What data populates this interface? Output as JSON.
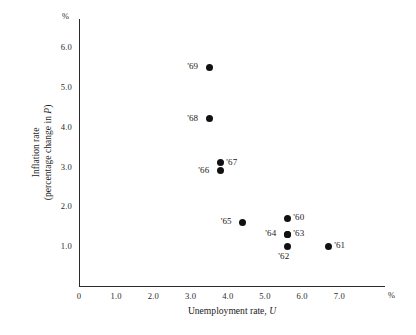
{
  "chart_data": {
    "type": "scatter",
    "title": "",
    "xlabel": "Unemployment rate, U",
    "ylabel_line1": "Inflation rate",
    "ylabel_line2": "(percentage change in P)",
    "x_unit": "%",
    "y_unit": "%",
    "xlim": [
      0,
      8.2
    ],
    "ylim": [
      0,
      6.7
    ],
    "grid": false,
    "legend": "none",
    "xticks": [
      "0",
      "1.0",
      "2.0",
      "3.0",
      "4.0",
      "5.0",
      "6.0",
      "7.0"
    ],
    "xtick_values": [
      0,
      1.0,
      2.0,
      3.0,
      4.0,
      5.0,
      6.0,
      7.0
    ],
    "yticks": [
      "1.0",
      "2.0",
      "3.0",
      "4.0",
      "5.0",
      "6.0"
    ],
    "ytick_values": [
      1.0,
      2.0,
      3.0,
      4.0,
      5.0,
      6.0
    ],
    "points": [
      {
        "label": "'69",
        "x": 3.5,
        "y": 5.5,
        "label_side": "left"
      },
      {
        "label": "'68",
        "x": 3.5,
        "y": 4.2,
        "label_side": "left"
      },
      {
        "label": "'67",
        "x": 3.8,
        "y": 3.1,
        "label_side": "right"
      },
      {
        "label": "'66",
        "x": 3.8,
        "y": 2.9,
        "label_side": "left"
      },
      {
        "label": "'65",
        "x": 4.4,
        "y": 1.6,
        "label_side": "left"
      },
      {
        "label": "'60",
        "x": 5.6,
        "y": 1.7,
        "label_side": "right"
      },
      {
        "label": "'64",
        "x": 5.6,
        "y": 1.3,
        "label_side": "left"
      },
      {
        "label": "'63",
        "x": 5.6,
        "y": 1.3,
        "label_side": "right"
      },
      {
        "label": "'62",
        "x": 5.6,
        "y": 1.0,
        "label_side": "below"
      },
      {
        "label": "'61",
        "x": 6.7,
        "y": 1.0,
        "label_side": "right"
      }
    ]
  },
  "axes": {
    "x_title_text": "Unemployment rate, ",
    "x_title_italic": "U",
    "y_title_line1": "Inflation rate",
    "y_title_line2_pre": "(percentage change in ",
    "y_title_line2_italic": "P",
    "y_title_line2_post": ")",
    "percent_symbol": "%"
  }
}
